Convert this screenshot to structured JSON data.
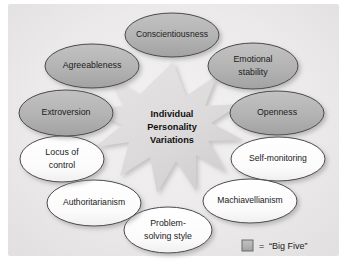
{
  "diagram": {
    "title_center": {
      "lines": [
        "Individual",
        "Personality",
        "Variations"
      ],
      "font_size": 9.2
    },
    "background_color": "#ffffff",
    "panel_color": "#eceaea",
    "starburst_color": "#dedcdc",
    "starburst_shadow_color": "#c8c6c6",
    "big_five_fill": "#b3b3b3",
    "other_fill": "#fdfdfd",
    "stroke_color": "#4a4a4a",
    "text_color": "#1b1b1b",
    "nodes": [
      {
        "id": "conscientiousness",
        "label": "Conscientiousness",
        "lines": [
          "Conscientiousness"
        ],
        "big_five": true,
        "cx": 172,
        "cy": 35,
        "rx": 47,
        "ry": 22,
        "font_size": 8.6
      },
      {
        "id": "emotional-stability",
        "label": "Emotional stability",
        "lines": [
          "Emotional",
          "stability"
        ],
        "big_five": true,
        "cx": 253,
        "cy": 66,
        "rx": 45,
        "ry": 23,
        "font_size": 8.8
      },
      {
        "id": "openness",
        "label": "Openness",
        "lines": [
          "Openness"
        ],
        "big_five": true,
        "cx": 277,
        "cy": 113,
        "rx": 47,
        "ry": 22,
        "font_size": 8.8
      },
      {
        "id": "self-monitoring",
        "label": "Self-monitoring",
        "lines": [
          "Self-monitoring"
        ],
        "big_five": false,
        "cx": 278,
        "cy": 159,
        "rx": 47,
        "ry": 22,
        "font_size": 8.6
      },
      {
        "id": "machiavellianism",
        "label": "Machiavellianism",
        "lines": [
          "Machiavellianism"
        ],
        "big_five": false,
        "cx": 250,
        "cy": 201,
        "rx": 47,
        "ry": 22,
        "font_size": 8.6
      },
      {
        "id": "problem-solving-style",
        "label": "Problem-solving style",
        "lines": [
          "Problem-",
          "solving style"
        ],
        "big_five": false,
        "cx": 168,
        "cy": 230,
        "rx": 44,
        "ry": 23,
        "font_size": 8.8
      },
      {
        "id": "authoritarianism",
        "label": "Authoritarianism",
        "lines": [
          "Authoritarianism"
        ],
        "big_five": false,
        "cx": 94,
        "cy": 203,
        "rx": 47,
        "ry": 23,
        "font_size": 8.6
      },
      {
        "id": "locus-of-control",
        "label": "Locus of control",
        "lines": [
          "Locus of",
          "control"
        ],
        "big_five": false,
        "cx": 62,
        "cy": 159,
        "rx": 42,
        "ry": 23,
        "font_size": 8.8
      },
      {
        "id": "extroversion",
        "label": "Extroversion",
        "lines": [
          "Extroversion"
        ],
        "big_five": true,
        "cx": 66,
        "cy": 113,
        "rx": 47,
        "ry": 23,
        "font_size": 8.8
      },
      {
        "id": "agreeableness",
        "label": "Agreeableness",
        "lines": [
          "Agreeableness"
        ],
        "big_five": true,
        "cx": 92,
        "cy": 66,
        "rx": 47,
        "ry": 22,
        "font_size": 8.8
      }
    ],
    "legend": {
      "swatch_color": "#b3b3b3",
      "equals": "=",
      "label": "“Big Five”",
      "font_size": 9
    }
  }
}
